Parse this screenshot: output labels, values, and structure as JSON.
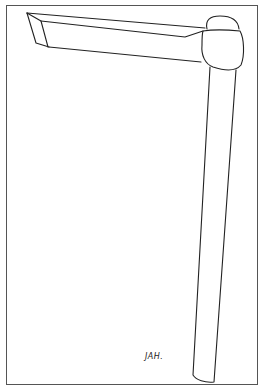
{
  "image": {
    "subject": "line drawing of a chisel-like tool with long shaft and angled blade",
    "signature": "JAH."
  },
  "colors": {
    "background": "#ffffff",
    "ink": "#222222",
    "frame": "#555555"
  }
}
